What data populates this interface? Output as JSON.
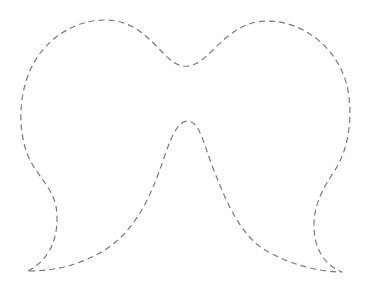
{
  "figure": {
    "background": "#ffffff",
    "stroke_color": "#7a7a7a",
    "stroke_dash": "6 4"
  }
}
